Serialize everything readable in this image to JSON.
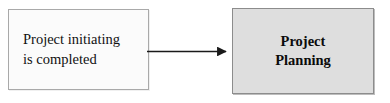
{
  "diagram": {
    "type": "flow-diagram",
    "background_color": "#ffffff",
    "nodes": [
      {
        "id": "event",
        "label": "Project initiating\nis completed",
        "shape": "rectangle",
        "fill_color": "#fbfbfb",
        "border_color": "#a9a9a9",
        "text_align": "left",
        "font_weight": "normal"
      },
      {
        "id": "phase",
        "label": "Project\nPlanning",
        "shape": "rectangle",
        "fill_color": "#dedede",
        "border_color": "#8c8c8c",
        "text_align": "center",
        "font_weight": "bold"
      }
    ],
    "connectors": [
      {
        "id": "event-to-phase",
        "from": "event",
        "to": "phase",
        "style": "solid",
        "direction": "right",
        "arrowhead": "filled-triangle",
        "color": "#1a1a1a",
        "label": ""
      }
    ]
  }
}
